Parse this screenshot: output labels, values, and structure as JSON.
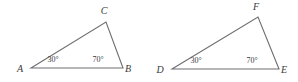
{
  "figure": {
    "type": "geometry-diagram",
    "background_color": "#ffffff",
    "stroke_color": "#6e6e72",
    "text_color": "#3a3a3a",
    "degree_symbol": "°"
  },
  "triangles": [
    {
      "id": "triangle-abc",
      "name": "triangle ABC",
      "vertices": [
        {
          "key": "A",
          "label": "A",
          "x": 31,
          "y": 68,
          "label_x": 20,
          "label_y": 72
        },
        {
          "key": "B",
          "label": "B",
          "x": 123,
          "y": 68,
          "label_x": 128,
          "label_y": 72
        },
        {
          "key": "C",
          "label": "C",
          "x": 106,
          "y": 22,
          "label_x": 104,
          "label_y": 14
        }
      ],
      "path": "M 31 68 L 106 22 L 123 68 Z",
      "angles": [
        {
          "at": "A",
          "value": "30",
          "text": "30°",
          "x": 53,
          "y": 62
        },
        {
          "at": "B",
          "value": "70",
          "text": "70°",
          "x": 98,
          "y": 62
        }
      ]
    },
    {
      "id": "triangle-def",
      "name": "triangle DEF",
      "vertices": [
        {
          "key": "D",
          "label": "D",
          "x": 172,
          "y": 69,
          "label_x": 160,
          "label_y": 73
        },
        {
          "key": "E",
          "label": "E",
          "x": 279,
          "y": 69,
          "label_x": 284,
          "label_y": 73
        },
        {
          "key": "F",
          "label": "F",
          "x": 258,
          "y": 17,
          "label_x": 256,
          "label_y": 10
        }
      ],
      "path": "M 172 69 L 258 17 L 279 69 Z",
      "angles": [
        {
          "at": "D",
          "value": "30",
          "text": "30°",
          "x": 196,
          "y": 63
        },
        {
          "at": "E",
          "value": "70",
          "text": "70°",
          "x": 252,
          "y": 63
        }
      ]
    }
  ]
}
